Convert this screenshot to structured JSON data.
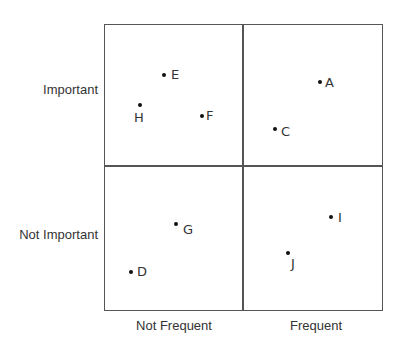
{
  "diagram": {
    "type": "2x2 matrix",
    "y_axis": {
      "top_label": "Important",
      "bottom_label": "Not Important"
    },
    "x_axis": {
      "left_label": "Not Frequent",
      "right_label": "Frequent"
    },
    "quadrants": [
      {
        "position": "top-left",
        "name": "Important / Not Frequent",
        "points": [
          "E",
          "H",
          "F"
        ]
      },
      {
        "position": "top-right",
        "name": "Important / Frequent",
        "points": [
          "A",
          "C"
        ]
      },
      {
        "position": "bottom-left",
        "name": "Not Important / Not Frequent",
        "points": [
          "G",
          "D"
        ]
      },
      {
        "position": "bottom-right",
        "name": "Not Important / Frequent",
        "points": [
          "I",
          "J"
        ]
      }
    ],
    "points": [
      {
        "label": "E",
        "x": 164,
        "y": 75,
        "lx": 171,
        "ly": 67
      },
      {
        "label": "H",
        "x": 140,
        "y": 105,
        "lx": 134,
        "ly": 110
      },
      {
        "label": "F",
        "x": 202,
        "y": 116,
        "lx": 206,
        "ly": 108
      },
      {
        "label": "A",
        "x": 320,
        "y": 82,
        "lx": 325,
        "ly": 75
      },
      {
        "label": "C",
        "x": 275,
        "y": 129,
        "lx": 281,
        "ly": 124
      },
      {
        "label": "G",
        "x": 176,
        "y": 224,
        "lx": 183,
        "ly": 222
      },
      {
        "label": "D",
        "x": 131,
        "y": 272,
        "lx": 137,
        "ly": 264
      },
      {
        "label": "I",
        "x": 331,
        "y": 217,
        "lx": 338,
        "ly": 210
      },
      {
        "label": "J",
        "x": 288,
        "y": 253,
        "lx": 291,
        "ly": 256
      }
    ]
  }
}
